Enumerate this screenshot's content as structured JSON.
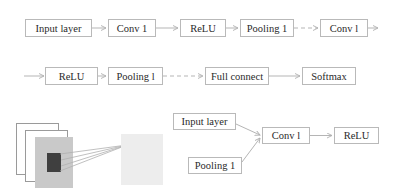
{
  "top_pipeline": {
    "row1": [
      {
        "label": "Input layer"
      },
      {
        "label": "Conv 1"
      },
      {
        "label": "ReLU"
      },
      {
        "label": "Pooling 1"
      },
      {
        "label": "Conv l"
      }
    ],
    "row2": [
      {
        "label": "ReLU"
      },
      {
        "label": "Pooling l"
      },
      {
        "label": "Full connect"
      },
      {
        "label": "Softmax"
      }
    ]
  },
  "bottom_diagram": {
    "inputs": [
      {
        "label": "Input layer"
      },
      {
        "label": "Pooling 1"
      }
    ],
    "conv": {
      "label": "Conv l"
    },
    "activation": {
      "label": "ReLU"
    },
    "colors": {
      "box_border": "#b9b9b9",
      "arrow": "#b5b5b5",
      "feature_map_front": "#c9c9c9",
      "kernel": "#3f3f3f",
      "output_panel": "#ededed"
    }
  }
}
